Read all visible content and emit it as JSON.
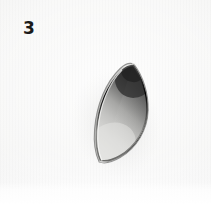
{
  "figure": {
    "step_number": "3",
    "alt_text": "Step 3: a pointed oval leaf shaped metal cutter photographed on a plain white background",
    "background_color": "#f5f5f4",
    "metal_light_color": "#e8e8e6",
    "metal_mid_color": "#b6b6b4",
    "metal_dark_color": "#3a3a3a",
    "label_color": "#1a1a1a",
    "shadow_color": "#d9d9d7"
  }
}
